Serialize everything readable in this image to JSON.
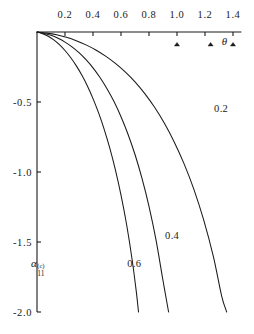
{
  "figure": {
    "background_color": "#ffffff",
    "line_color": "#1a1a1a",
    "axis_color": "#1a1a1a"
  },
  "chart_data": {
    "type": "line",
    "title": "",
    "xlabel": "θ",
    "ylabel": "α",
    "ylabel_sub": "11",
    "ylabel_sup": "(c)",
    "xlim": [
      0.0,
      1.5
    ],
    "ylim": [
      -2.0,
      0.0
    ],
    "grid": false,
    "legend_position": "inline-curve-labels",
    "xaxis_position": "top",
    "xticks": [
      0.2,
      0.4,
      0.6,
      0.8,
      1.0,
      1.2,
      1.4
    ],
    "xtick_labels": [
      "0.2",
      "0.4",
      "0.6",
      "0.8",
      "1.0",
      "1.2",
      "1.4"
    ],
    "yticks": [
      -0.5,
      -1.0,
      -1.5,
      -2.0
    ],
    "ytick_labels": [
      "-0.5",
      "-1.0",
      "-1.5",
      "-2.0"
    ],
    "markers": {
      "symbol": "triangle",
      "x_positions": [
        1.0,
        1.24,
        1.4
      ],
      "label": "θ",
      "label_x": 1.32
    },
    "series": [
      {
        "name": "0.6",
        "label": "0.6",
        "label_x": 0.645,
        "label_y": -1.655,
        "points": [
          [
            0.0,
            0.0
          ],
          [
            0.04,
            -0.012
          ],
          [
            0.08,
            -0.03
          ],
          [
            0.12,
            -0.056
          ],
          [
            0.16,
            -0.09
          ],
          [
            0.2,
            -0.132
          ],
          [
            0.24,
            -0.182
          ],
          [
            0.28,
            -0.24
          ],
          [
            0.32,
            -0.308
          ],
          [
            0.36,
            -0.386
          ],
          [
            0.4,
            -0.476
          ],
          [
            0.44,
            -0.578
          ],
          [
            0.48,
            -0.695
          ],
          [
            0.52,
            -0.83
          ],
          [
            0.56,
            -0.985
          ],
          [
            0.6,
            -1.165
          ],
          [
            0.64,
            -1.375
          ],
          [
            0.68,
            -1.63
          ],
          [
            0.71,
            -1.86
          ],
          [
            0.725,
            -2.0
          ]
        ]
      },
      {
        "name": "0.4",
        "label": "0.4",
        "label_x": 0.915,
        "label_y": -1.455,
        "points": [
          [
            0.0,
            0.0
          ],
          [
            0.05,
            -0.01
          ],
          [
            0.1,
            -0.024
          ],
          [
            0.15,
            -0.045
          ],
          [
            0.2,
            -0.072
          ],
          [
            0.25,
            -0.106
          ],
          [
            0.3,
            -0.148
          ],
          [
            0.35,
            -0.198
          ],
          [
            0.4,
            -0.256
          ],
          [
            0.45,
            -0.325
          ],
          [
            0.5,
            -0.405
          ],
          [
            0.55,
            -0.497
          ],
          [
            0.6,
            -0.605
          ],
          [
            0.65,
            -0.73
          ],
          [
            0.7,
            -0.875
          ],
          [
            0.75,
            -1.045
          ],
          [
            0.8,
            -1.245
          ],
          [
            0.85,
            -1.485
          ],
          [
            0.9,
            -1.775
          ],
          [
            0.94,
            -2.0
          ]
        ]
      },
      {
        "name": "0.2",
        "label": "0.2",
        "label_x": 1.265,
        "label_y": -0.55,
        "points": [
          [
            0.0,
            0.0
          ],
          [
            0.07,
            -0.008
          ],
          [
            0.14,
            -0.02
          ],
          [
            0.21,
            -0.038
          ],
          [
            0.28,
            -0.062
          ],
          [
            0.35,
            -0.092
          ],
          [
            0.42,
            -0.128
          ],
          [
            0.49,
            -0.172
          ],
          [
            0.56,
            -0.224
          ],
          [
            0.63,
            -0.285
          ],
          [
            0.7,
            -0.356
          ],
          [
            0.77,
            -0.44
          ],
          [
            0.84,
            -0.538
          ],
          [
            0.91,
            -0.652
          ],
          [
            0.98,
            -0.785
          ],
          [
            1.05,
            -0.94
          ],
          [
            1.12,
            -1.122
          ],
          [
            1.19,
            -1.34
          ],
          [
            1.26,
            -1.605
          ],
          [
            1.32,
            -1.89
          ],
          [
            1.355,
            -2.0
          ]
        ]
      }
    ]
  }
}
